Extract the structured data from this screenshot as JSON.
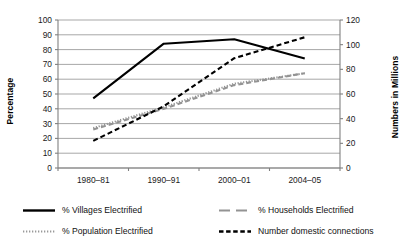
{
  "chart_data": {
    "type": "line",
    "title": "",
    "xlabel": "",
    "ylabel": "Percentage",
    "y2label": "Numbers in Millions",
    "categories": [
      "1980–81",
      "1990–91",
      "2000–01",
      "2004–05"
    ],
    "ylim": [
      0,
      100
    ],
    "y2lim": [
      0,
      120
    ],
    "yticks": [
      0,
      10,
      20,
      30,
      40,
      50,
      60,
      70,
      80,
      90,
      100
    ],
    "y2ticks": [
      0,
      20,
      40,
      60,
      80,
      100,
      120
    ],
    "grid": "horizontal",
    "legend_position": "bottom",
    "series": [
      {
        "name": "% Villages Electrified",
        "axis": "left",
        "style": "solid",
        "color": "#000000",
        "values": [
          47,
          84,
          87,
          74
        ]
      },
      {
        "name": "% Households Electrified",
        "axis": "left",
        "style": "dashed",
        "color": "#939393",
        "values": [
          26,
          40,
          56,
          64
        ]
      },
      {
        "name": "% Population Electrified",
        "axis": "left",
        "style": "dotted",
        "color": "#939393",
        "values": [
          27,
          41,
          57,
          64
        ]
      },
      {
        "name": "Number domestic connections",
        "axis": "right",
        "style": "dashed",
        "color": "#000000",
        "values": [
          22,
          50,
          89,
          106
        ]
      }
    ]
  },
  "axes": {
    "left_title": "Percentage",
    "right_title": "Numbers in Millions",
    "left_ticks": [
      "100",
      "90",
      "80",
      "70",
      "60",
      "50",
      "40",
      "30",
      "20",
      "10",
      "0"
    ],
    "right_ticks": [
      "120",
      "100",
      "80",
      "60",
      "40",
      "20",
      "0"
    ],
    "category_labels": [
      "1980–81",
      "1990–91",
      "2000–01",
      "2004–05"
    ]
  },
  "legend": {
    "items": [
      {
        "label": "% Villages Electrified",
        "style": "solid",
        "color": "#000000"
      },
      {
        "label": "% Households Electrified",
        "style": "long-dash",
        "color": "#939393"
      },
      {
        "label": "% Population Electrified",
        "style": "dotted",
        "color": "#9a9a9a"
      },
      {
        "label": "Number domestic connections",
        "style": "dashed",
        "color": "#000000"
      }
    ]
  },
  "colors": {
    "axis": "#808080",
    "grid": "#9d9d9d",
    "series_black": "#000000",
    "series_gray": "#939393",
    "background": "#ffffff"
  }
}
